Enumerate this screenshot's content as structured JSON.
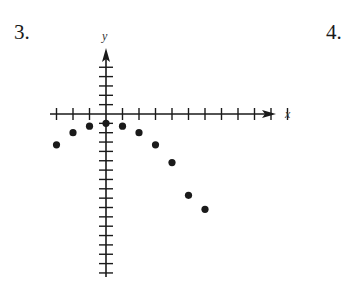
{
  "problems": {
    "left_number": "3.",
    "right_number": "4."
  },
  "chart_data": {
    "type": "scatter",
    "title": "",
    "xlabel": "x",
    "ylabel": "y",
    "x_ticks": [
      -3,
      -2,
      -1,
      0,
      1,
      2,
      3,
      4,
      5,
      6,
      7,
      8,
      9,
      10,
      11
    ],
    "y_ticks": [
      5,
      4,
      3,
      2,
      1,
      0,
      -1,
      -2,
      -3,
      -4,
      -5,
      -6,
      -7,
      -8,
      -9,
      -10,
      -11,
      -12,
      -13,
      -14,
      -15,
      -16,
      -17
    ],
    "xlim": [
      -3.5,
      12
    ],
    "ylim": [
      -17.5,
      6.5
    ],
    "grid": false,
    "tick_labels_shown": false,
    "series": [
      {
        "name": "points",
        "x": [
          -3,
          -2,
          -1,
          0,
          1,
          2,
          3,
          4,
          5,
          6
        ],
        "y": [
          -3.3,
          -2,
          -1.3,
          -1,
          -1.3,
          -2,
          -3.3,
          -5.2,
          -8.7,
          -10.2
        ]
      }
    ],
    "colors": {
      "ink": "#1a1a1a"
    }
  }
}
